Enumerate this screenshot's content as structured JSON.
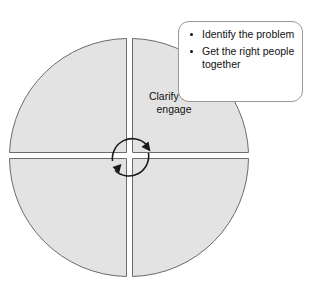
{
  "diagram": {
    "shape": "four-quadrant-circle",
    "fill_color": "#e3e3e3",
    "stroke_color": "#6b6b6b",
    "background_color": "#ffffff",
    "quadrants": [
      {
        "id": "top-left",
        "label": ""
      },
      {
        "id": "top-right",
        "label": "Clarify and\nengage"
      },
      {
        "id": "bottom-right",
        "label": ""
      },
      {
        "id": "bottom-left",
        "label": ""
      }
    ],
    "center_cycle": {
      "name": "circular-arrow",
      "direction": "clockwise",
      "arrowhead_count": 2
    }
  },
  "callout": {
    "name": "callout-box",
    "border_color": "#9a9a9a",
    "background_color": "#ffffff",
    "bullets": [
      "Identify the problem",
      "Get the right people together"
    ]
  }
}
